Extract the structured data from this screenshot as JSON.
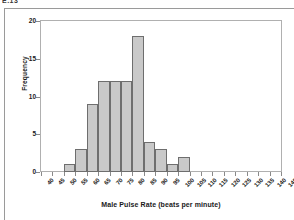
{
  "figure": {
    "clipped_top_text": "E.13"
  },
  "chart_data": {
    "type": "bar",
    "title": "",
    "subtitle": "",
    "xlabel": "Male Pulse Rate (beats per minute)",
    "ylabel": "Frequency",
    "bin_width": 5,
    "xlim": [
      40,
      145
    ],
    "ylim": [
      0,
      20
    ],
    "grid": false,
    "legend": null,
    "x_tick_labels": [
      "40",
      "45",
      "50",
      "55",
      "60",
      "65",
      "70",
      "75",
      "80",
      "85",
      "90",
      "95",
      "100",
      "105",
      "110",
      "115",
      "120",
      "125",
      "130",
      "135",
      "140",
      "145"
    ],
    "x_tick_values": [
      40,
      45,
      50,
      55,
      60,
      65,
      70,
      75,
      80,
      85,
      90,
      95,
      100,
      105,
      110,
      115,
      120,
      125,
      130,
      135,
      140,
      145
    ],
    "y_tick_labels": [
      "0",
      "5",
      "10",
      "15",
      "20"
    ],
    "y_tick_values": [
      0,
      5,
      10,
      15,
      20
    ],
    "bins": [
      {
        "start": 40,
        "end": 45,
        "value": 0
      },
      {
        "start": 45,
        "end": 50,
        "value": 0
      },
      {
        "start": 50,
        "end": 55,
        "value": 1
      },
      {
        "start": 55,
        "end": 60,
        "value": 3
      },
      {
        "start": 60,
        "end": 65,
        "value": 9
      },
      {
        "start": 65,
        "end": 70,
        "value": 12
      },
      {
        "start": 70,
        "end": 75,
        "value": 12
      },
      {
        "start": 75,
        "end": 80,
        "value": 12
      },
      {
        "start": 80,
        "end": 85,
        "value": 18
      },
      {
        "start": 85,
        "end": 90,
        "value": 4
      },
      {
        "start": 90,
        "end": 95,
        "value": 3
      },
      {
        "start": 95,
        "end": 100,
        "value": 1
      },
      {
        "start": 100,
        "end": 105,
        "value": 2
      },
      {
        "start": 105,
        "end": 110,
        "value": 0
      },
      {
        "start": 110,
        "end": 115,
        "value": 0
      },
      {
        "start": 115,
        "end": 120,
        "value": 0
      },
      {
        "start": 120,
        "end": 125,
        "value": 0
      },
      {
        "start": 125,
        "end": 130,
        "value": 0
      },
      {
        "start": 130,
        "end": 135,
        "value": 0
      },
      {
        "start": 135,
        "end": 140,
        "value": 0
      },
      {
        "start": 140,
        "end": 145,
        "value": 0
      }
    ],
    "categories": [
      "40-45",
      "45-50",
      "50-55",
      "55-60",
      "60-65",
      "65-70",
      "70-75",
      "75-80",
      "80-85",
      "85-90",
      "90-95",
      "95-100",
      "100-105",
      "105-110",
      "110-115",
      "115-120",
      "120-125",
      "125-130",
      "130-135",
      "135-140",
      "140-145"
    ],
    "values": [
      0,
      0,
      1,
      3,
      9,
      12,
      12,
      12,
      18,
      4,
      3,
      1,
      2,
      0,
      0,
      0,
      0,
      0,
      0,
      0,
      0
    ],
    "colors": {
      "bar_fill": "#c9c9c9",
      "bar_border": "#6e6e6e",
      "frame": "#b0b0b0",
      "text": "#1a1a1a",
      "background": "#ffffff"
    }
  }
}
